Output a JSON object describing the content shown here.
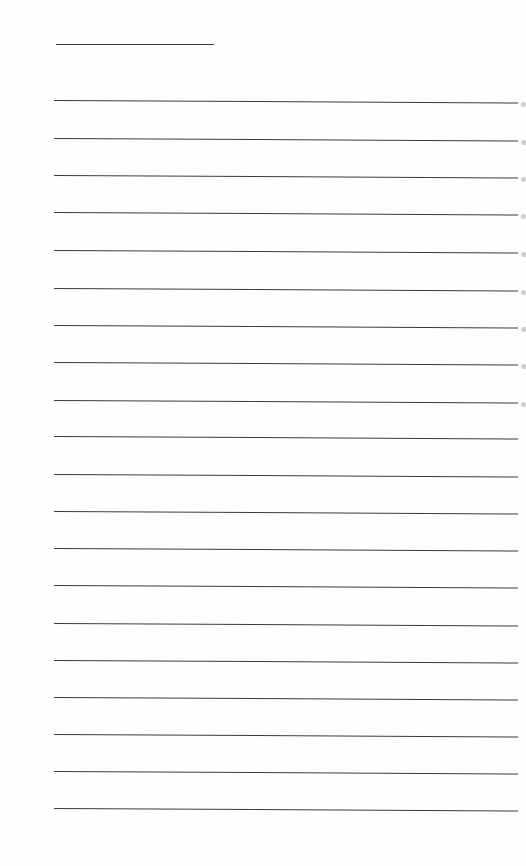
{
  "document": {
    "type": "lined-paper",
    "title_line": {
      "top": 44,
      "left": 56,
      "width": 158
    },
    "rule_lines": [
      100,
      138,
      175,
      212,
      250,
      288,
      325,
      362,
      400,
      436,
      474,
      511,
      548,
      585,
      623,
      660,
      697,
      734,
      771,
      808
    ],
    "edge_marks": [
      102,
      140,
      177,
      214,
      252,
      290,
      327,
      364,
      402
    ],
    "line_color": "#3a3a3a",
    "background_color": "#fefefe"
  }
}
